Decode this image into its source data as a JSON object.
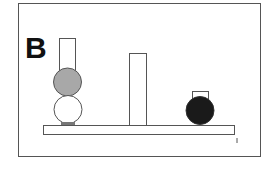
{
  "figure": {
    "panel_label": "B",
    "colors": {
      "outline": "#555555",
      "gray_ball": "#a8a8a8",
      "white_ball": "#ffffff",
      "black_ball": "#1a1a1a",
      "background": "#ffffff"
    },
    "elements": [
      {
        "id": "left-tall-block",
        "type": "rect",
        "x": 59,
        "y": 38,
        "w": 16,
        "h": 32
      },
      {
        "id": "gray-ball",
        "type": "circle",
        "cx": 67,
        "cy": 82,
        "r": 14
      },
      {
        "id": "white-ball",
        "type": "circle",
        "cx": 68,
        "cy": 109,
        "r": 14
      },
      {
        "id": "middle-tall-block",
        "type": "rect",
        "x": 129,
        "y": 53,
        "w": 17,
        "h": 73
      },
      {
        "id": "right-small-block",
        "type": "rect",
        "x": 192,
        "y": 91,
        "w": 16,
        "h": 9
      },
      {
        "id": "black-ball",
        "type": "circle",
        "cx": 200,
        "cy": 110,
        "r": 14
      },
      {
        "id": "base-plank",
        "type": "rect",
        "x": 43,
        "y": 125,
        "w": 192,
        "h": 10
      }
    ]
  }
}
